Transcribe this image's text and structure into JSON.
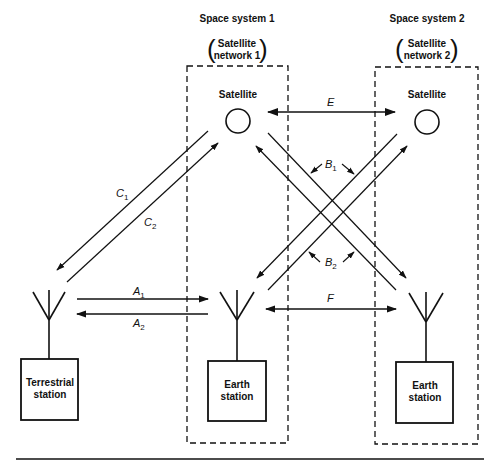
{
  "diagram": {
    "type": "satellite interference geometry",
    "space_systems": [
      {
        "title": "Space system 1",
        "subtitle_line1": "Satellite",
        "subtitle_line2": "network 1",
        "satellite_label": "Satellite",
        "earth_station_line1": "Earth",
        "earth_station_line2": "station"
      },
      {
        "title": "Space system 2",
        "subtitle_line1": "Satellite",
        "subtitle_line2": "network 2",
        "satellite_label": "Satellite",
        "earth_station_line1": "Earth",
        "earth_station_line2": "station"
      }
    ],
    "terrestrial_station": {
      "line1": "Terrestrial",
      "line2": "station"
    },
    "paths": {
      "A1": {
        "letter": "A",
        "sub": "1"
      },
      "A2": {
        "letter": "A",
        "sub": "2"
      },
      "B1": {
        "letter": "B",
        "sub": "1"
      },
      "B2": {
        "letter": "B",
        "sub": "2"
      },
      "C1": {
        "letter": "C",
        "sub": "1"
      },
      "C2": {
        "letter": "C",
        "sub": "2"
      },
      "E": {
        "letter": "E"
      },
      "F": {
        "letter": "F"
      }
    },
    "colors": {
      "ink": "#111111",
      "background": "#ffffff"
    }
  }
}
